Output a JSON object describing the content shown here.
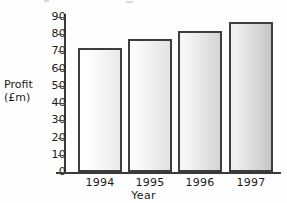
{
  "chart_data": {
    "type": "bar",
    "title": "",
    "categories": [
      "1994",
      "1995",
      "1996",
      "1997"
    ],
    "values": [
      72,
      77,
      82,
      87
    ],
    "xlabel": "Year",
    "ylabel": "Profit (£m)",
    "ylabel_line1": "Profit",
    "ylabel_line2": "(£m)",
    "ylim": [
      0,
      90
    ],
    "ytick_step": 10,
    "yticks": [
      "90",
      "80",
      "70",
      "60",
      "50",
      "40",
      "30",
      "20",
      "10",
      "0"
    ],
    "ytick_values": [
      90,
      80,
      70,
      60,
      50,
      40,
      30,
      20,
      10,
      0
    ],
    "grid": false,
    "legend": false,
    "bar_fills": [
      {
        "from": "#ffffff",
        "to": "#eaeaea"
      },
      {
        "from": "#fbfbfb",
        "to": "#e2e2e2"
      },
      {
        "from": "#f6f6f6",
        "to": "#d5d5d5"
      },
      {
        "from": "#efefef",
        "to": "#c6c6c6"
      }
    ],
    "bar_outline": "#3d3d3d",
    "axis_color": "#3a3a3a"
  }
}
